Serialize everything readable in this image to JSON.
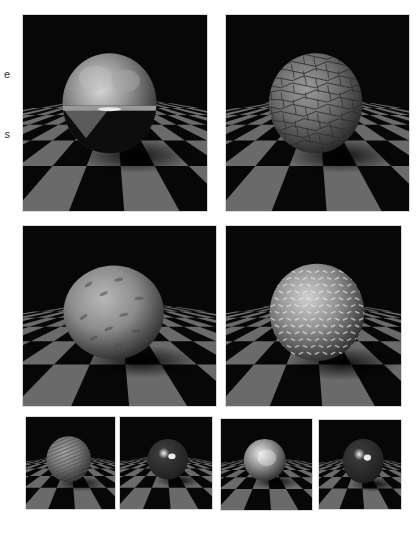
{
  "page": {
    "background": "#ffffff",
    "left_text_fragments": [
      {
        "text": "e",
        "top": 68
      },
      {
        "text": "s",
        "top": 128
      }
    ]
  },
  "figure": {
    "panels": [
      {
        "id": "p1",
        "row": 1,
        "x": 23,
        "y": 15,
        "w": 184,
        "h": 196,
        "sphere": "reflective-chrome",
        "cx": 0.47,
        "cy": 0.45,
        "r": 0.255,
        "base": "#8a8a8a",
        "hi": "#d8d8d8",
        "texture": "reflect"
      },
      {
        "id": "p2",
        "row": 1,
        "x": 226,
        "y": 15,
        "w": 183,
        "h": 196,
        "sphere": "stone-brick-bump",
        "cx": 0.49,
        "cy": 0.45,
        "r": 0.255,
        "base": "#6e6e6e",
        "hi": "#9a9a9a",
        "texture": "cracks"
      },
      {
        "id": "p3",
        "row": 2,
        "x": 23,
        "y": 226,
        "w": 193,
        "h": 180,
        "sphere": "dented-matte",
        "cx": 0.47,
        "cy": 0.48,
        "r": 0.26,
        "base": "#8c8c8c",
        "hi": "#b8b8b8",
        "texture": "dents"
      },
      {
        "id": "p4",
        "row": 2,
        "x": 226,
        "y": 226,
        "w": 175,
        "h": 180,
        "sphere": "diamond-plate-bump",
        "cx": 0.52,
        "cy": 0.48,
        "r": 0.27,
        "base": "#8e8e8e",
        "hi": "#d0d0d0",
        "texture": "plate"
      },
      {
        "id": "p5",
        "row": 3,
        "x": 26,
        "y": 417,
        "w": 89,
        "h": 92,
        "sphere": "striped-bump",
        "cx": 0.48,
        "cy": 0.46,
        "r": 0.25,
        "base": "#7a7a7a",
        "hi": "#a4a4a4",
        "texture": "stripes"
      },
      {
        "id": "p6",
        "row": 3,
        "x": 120,
        "y": 417,
        "w": 92,
        "h": 92,
        "sphere": "glossy-dark",
        "cx": 0.52,
        "cy": 0.46,
        "r": 0.22,
        "base": "#3a3a3a",
        "hi": "#f2f2f2",
        "texture": "glossy"
      },
      {
        "id": "p7",
        "row": 3,
        "x": 221,
        "y": 419,
        "w": 91,
        "h": 91,
        "sphere": "bright-matte",
        "cx": 0.48,
        "cy": 0.45,
        "r": 0.23,
        "base": "#8e8e8e",
        "hi": "#e6e6e6",
        "texture": "soft"
      },
      {
        "id": "p8",
        "row": 3,
        "x": 319,
        "y": 420,
        "w": 82,
        "h": 89,
        "sphere": "glossy-dark-2",
        "cx": 0.54,
        "cy": 0.46,
        "r": 0.25,
        "base": "#383838",
        "hi": "#eeeeee",
        "texture": "glossy"
      }
    ],
    "floor": {
      "light": "#6a6a6a",
      "dark": "#060606",
      "sky": "#070707"
    }
  }
}
